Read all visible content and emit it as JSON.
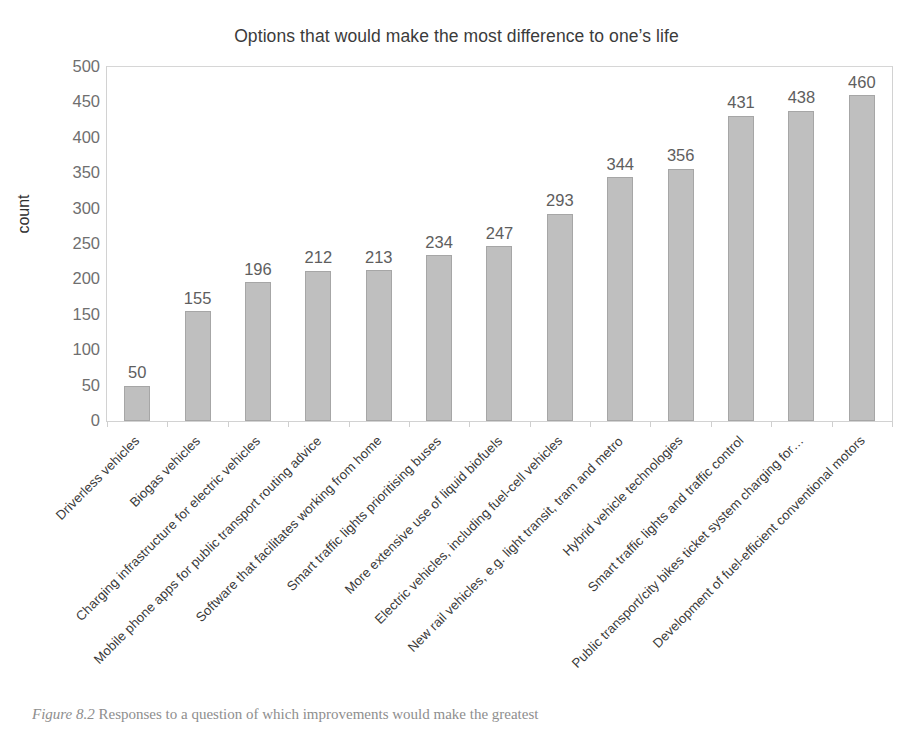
{
  "chart_data": {
    "type": "bar",
    "title": "Options that would make the most difference to one’s life",
    "xlabel": "",
    "ylabel": "count",
    "ylim": [
      0,
      500
    ],
    "ytick_step": 50,
    "yticks": [
      500,
      450,
      400,
      350,
      300,
      250,
      200,
      150,
      100,
      50,
      0
    ],
    "grid": false,
    "legend": "none",
    "orientation": "vertical",
    "bar_color": "#bfbfbf",
    "bar_edge_color": "#a6a6a6",
    "categories": [
      "Driverless vehicles",
      "Biogas vehicles",
      "Charging infrastructure for electric vehicles",
      "Mobile phone apps for public transport routing advice",
      "Software that facilitates working from home",
      "Smart traffic lights prioritising buses",
      "More extensive use of liquid biofuels",
      "Electric vehicles, including fuel-cell vehicles",
      "New rail vehicles, e.g. light transit, tram and metro",
      "Hybrid vehicle technologies",
      "Smart traffic lights and traffic control",
      "Public transport/city bikes ticket system charging for…",
      "Development of fuel-efficient conventional motors"
    ],
    "values": [
      50,
      155,
      196,
      212,
      213,
      234,
      247,
      293,
      344,
      356,
      431,
      438,
      460
    ],
    "data_labels": [
      "50",
      "155",
      "196",
      "212",
      "213",
      "234",
      "247",
      "293",
      "344",
      "356",
      "431",
      "438",
      "460"
    ]
  },
  "caption": {
    "figure_number": "Figure 8.2",
    "text": "Responses to a question of which improvements would make the greatest"
  }
}
